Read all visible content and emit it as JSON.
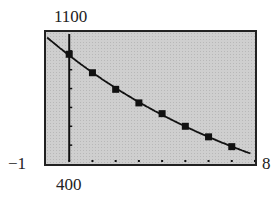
{
  "window": {
    "ymax_label": "1100",
    "ymin_label": "400",
    "xmin_label": "−1",
    "xmax_label": "8"
  },
  "chart_data": {
    "type": "scatter",
    "title": "",
    "xlabel": "",
    "ylabel": "",
    "xlim": [
      -1,
      8
    ],
    "ylim": [
      400,
      1100
    ],
    "grid": false,
    "x_ticks_dots": [
      0,
      1,
      2,
      3,
      4,
      5,
      6,
      7,
      8
    ],
    "series": [
      {
        "name": "data points",
        "x": [
          0,
          1,
          2,
          3,
          4,
          5,
          6,
          7
        ],
        "values": [
          982,
          884,
          796,
          724,
          667,
          600,
          544,
          492
        ]
      },
      {
        "name": "fitted curve",
        "style": "line",
        "x": [
          -1,
          8
        ],
        "description": "decreasing curve passing through the data points"
      }
    ],
    "colors": {
      "screen": "#cfcfcf",
      "ink": "#111111"
    }
  }
}
